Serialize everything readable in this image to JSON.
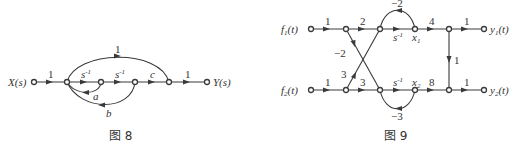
{
  "figure8": {
    "caption": "图 8",
    "input_label": "X(s)",
    "output_label": "Y(s)",
    "branches": {
      "in_gain": "1",
      "s1": "s",
      "s1_exp": "-1",
      "s2": "s",
      "s2_exp": "-1",
      "c": "c",
      "out_gain": "1",
      "top_arc": "1",
      "loop_a": "a",
      "loop_b": "b"
    }
  },
  "figure9": {
    "caption": "图 9",
    "inputs": [
      {
        "name": "f",
        "sub": "1",
        "arg": "(t)"
      },
      {
        "name": "f",
        "sub": "2",
        "arg": "(t)"
      }
    ],
    "outputs": [
      {
        "name": "y",
        "sub": "1",
        "arg": "(t)"
      },
      {
        "name": "y",
        "sub": "2",
        "arg": "(t)"
      }
    ],
    "top": {
      "in_gain": "1",
      "gain2": "2",
      "integrator": "s",
      "integrator_exp": "-1",
      "state": "x",
      "state_sub": "1",
      "gain4": "4",
      "out_gain": "1",
      "self_loop": "−2"
    },
    "bottom": {
      "in_gain": "1",
      "gain3": "3",
      "integrator": "s",
      "integrator_exp": "-1",
      "state": "x",
      "state_sub": "2",
      "gain8": "8",
      "out_gain": "1",
      "self_loop": "−3"
    },
    "cross": {
      "down_gain": "−2",
      "up_gain": "3"
    },
    "vertical_gain": "1"
  }
}
